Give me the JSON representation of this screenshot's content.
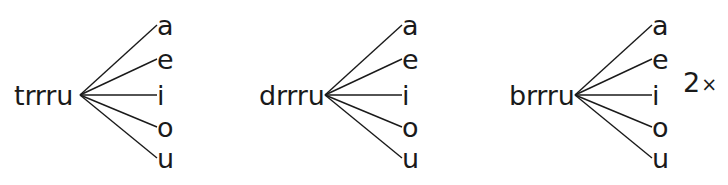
{
  "figure": {
    "type": "branching-diagram",
    "background_color": "#ffffff",
    "ink_color": "#1a1a1a",
    "groups": [
      {
        "label": "trrru",
        "origin_x": 14,
        "label_width": 66,
        "vertex_x": 80,
        "vowel_x": 157,
        "branches": [
          "a",
          "e",
          "i",
          "o",
          "u"
        ],
        "annotation": ""
      },
      {
        "label": "drrru",
        "origin_x": 259,
        "label_width": 66,
        "vertex_x": 325,
        "vowel_x": 402,
        "branches": [
          "a",
          "e",
          "i",
          "o",
          "u"
        ],
        "annotation": ""
      },
      {
        "label": "brrru",
        "origin_x": 509,
        "label_width": 66,
        "vertex_x": 575,
        "vowel_x": 652,
        "branches": [
          "a",
          "e",
          "i",
          "o",
          "u"
        ],
        "annotation": "2",
        "annotation_sign": "×",
        "annotation_x": 683,
        "annotation_y": 82
      }
    ],
    "branch_y": [
      25,
      59,
      95,
      127,
      158
    ],
    "vertex_y": 95
  }
}
